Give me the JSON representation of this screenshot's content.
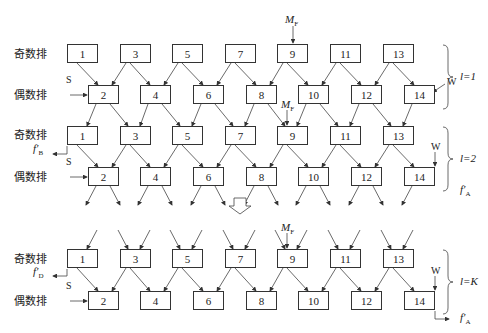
{
  "row_labels": {
    "odd": "奇数排",
    "even": "偶数排"
  },
  "odd_boxes": [
    "1",
    "3",
    "5",
    "7",
    "9",
    "11",
    "13"
  ],
  "even_boxes": [
    "2",
    "4",
    "6",
    "8",
    "10",
    "12",
    "14"
  ],
  "inputs": {
    "S": "S",
    "W": "W",
    "MF": "M",
    "MF_sub": "F"
  },
  "outputs": {
    "fB": "f",
    "fB_sub": "B",
    "fD": "f",
    "fD_sub": "D",
    "fA": "f",
    "fA_sub": "A",
    "prime": "′"
  },
  "stages": [
    {
      "label": "l=1"
    },
    {
      "label": "l=2"
    },
    {
      "label": "l=K"
    }
  ]
}
